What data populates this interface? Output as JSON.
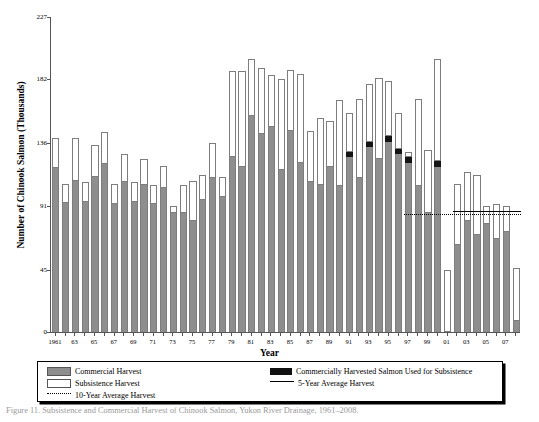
{
  "chart_data": {
    "type": "bar",
    "title": "",
    "xlabel": "Year",
    "ylabel": "Number of Chinook Salmon (Thousands)",
    "stacked": true,
    "grid": false,
    "ylim": [
      0,
      227
    ],
    "yticks": [
      0,
      45,
      91,
      136,
      182,
      227
    ],
    "ytick_labels": [
      "0",
      "45",
      "91",
      "136",
      "182",
      "227"
    ],
    "x": [
      1961,
      1962,
      1963,
      1964,
      1965,
      1966,
      1967,
      1968,
      1969,
      1970,
      1971,
      1972,
      1973,
      1974,
      1975,
      1976,
      1977,
      1978,
      1979,
      1980,
      1981,
      1982,
      1983,
      1984,
      1985,
      1986,
      1987,
      1988,
      1989,
      1990,
      1991,
      1992,
      1993,
      1994,
      1995,
      1996,
      1997,
      1998,
      1999,
      2000,
      2001,
      2002,
      2003,
      2004,
      2005,
      2006,
      2007,
      2008
    ],
    "xtick_labels": [
      "1961",
      "",
      "63",
      "",
      "65",
      "",
      "67",
      "",
      "69",
      "",
      "71",
      "",
      "73",
      "",
      "75",
      "",
      "77",
      "",
      "79",
      "",
      "81",
      "",
      "83",
      "",
      "85",
      "",
      "87",
      "",
      "89",
      "",
      "91",
      "",
      "93",
      "",
      "95",
      "",
      "97",
      "",
      "99",
      "",
      "01",
      "",
      "03",
      "",
      "05",
      "",
      "07",
      ""
    ],
    "series": [
      {
        "name": "Commercial Harvest",
        "color": "#8e8e8e",
        "values": [
          118,
          93,
          109,
          94,
          112,
          121,
          92,
          108,
          94,
          106,
          92,
          104,
          86,
          86,
          80,
          95,
          111,
          97,
          126,
          119,
          156,
          143,
          148,
          117,
          145,
          122,
          108,
          106,
          119,
          105,
          126,
          111,
          133,
          125,
          137,
          128,
          122,
          105,
          86,
          119,
          0,
          63,
          80,
          70,
          78,
          67,
          72,
          8
        ]
      },
      {
        "name": "Commercially Harvested Salmon Used for Subsistence",
        "color": "#141414",
        "values": [
          0,
          0,
          0,
          0,
          0,
          0,
          0,
          0,
          0,
          0,
          0,
          0,
          0,
          0,
          0,
          0,
          0,
          0,
          0,
          0,
          0,
          0,
          0,
          0,
          0,
          0,
          0,
          0,
          0,
          0,
          4,
          0,
          4,
          0,
          4,
          4,
          4,
          0,
          0,
          4,
          0,
          0,
          0,
          0,
          0,
          0,
          0,
          0
        ]
      },
      {
        "name": "Subsistence Harvest",
        "color": "#ffffff",
        "values": [
          22,
          14,
          31,
          14,
          23,
          23,
          15,
          20,
          14,
          19,
          14,
          16,
          5,
          20,
          29,
          18,
          25,
          15,
          62,
          69,
          41,
          47,
          37,
          65,
          44,
          64,
          37,
          48,
          33,
          62,
          28,
          57,
          42,
          58,
          40,
          26,
          4,
          63,
          45,
          74,
          45,
          44,
          35,
          43,
          13,
          25,
          19,
          38
        ]
      }
    ],
    "totals": [
      140,
      107,
      140,
      108,
      135,
      144,
      107,
      128,
      108,
      125,
      106,
      120,
      91,
      106,
      109,
      113,
      136,
      112,
      188,
      188,
      197,
      190,
      185,
      182,
      189,
      186,
      145,
      154,
      152,
      167,
      158,
      168,
      179,
      183,
      181,
      158,
      130,
      168,
      131,
      197,
      45,
      107,
      115,
      113,
      91,
      92,
      91,
      46
    ],
    "reference_lines": [
      {
        "name": "10-Year Average Harvest",
        "style": "dotted",
        "value": 85,
        "x_start": 1997,
        "x_end": 2008
      },
      {
        "name": "5-Year Average Harvest",
        "style": "solid",
        "value": 87,
        "x_start": 2002,
        "x_end": 2008
      }
    ],
    "legend_position": "bottom"
  },
  "axes": {
    "y_title": "Number of Chinook Salmon (Thousands)",
    "x_title": "Year"
  },
  "legend": {
    "items": [
      {
        "key": "swatch-gray",
        "label": "Commercial Harvest"
      },
      {
        "key": "swatch-white",
        "label": "Subsistence Harvest"
      },
      {
        "key": "dotted-line",
        "label": "10-Year Average Harvest"
      },
      {
        "key": "swatch-black",
        "label": "Commercially Harvested Salmon Used for Subsistence"
      },
      {
        "key": "solid-line",
        "label": "5-Year Average Harvest"
      }
    ]
  },
  "caption": {
    "text": "Figure 11. Subsistence and Commercial Harvest of Chinook Salmon, Yukon River Drainage, 1961–2008."
  },
  "colors": {
    "commercial": "#8e8e8e",
    "subsistence": "#ffffff",
    "commercial_used_subsistence": "#141414",
    "axis": "#555555"
  }
}
